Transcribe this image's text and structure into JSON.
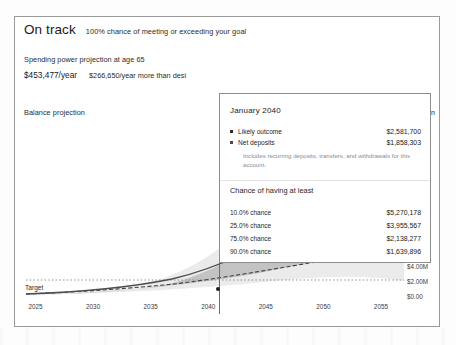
{
  "header": {
    "status_title": "On track",
    "status_subtitle": "100% chance of meeting or exceeding your goal"
  },
  "spending": {
    "label": "Spending power projection at age 65",
    "primary_value": "$453,477/year",
    "secondary_value": "$266,650/year more than desi"
  },
  "balance": {
    "label": "Balance projection",
    "right_label": "ection"
  },
  "target": {
    "label": "Target"
  },
  "tooltip": {
    "title": "January 2040",
    "rows": [
      {
        "bullet": "solid-square-bullet",
        "name": "Likely outcome",
        "value": "$2,581,700"
      },
      {
        "bullet": "solid-square-bullet",
        "name": "Net deposits",
        "value": "$1,858,303"
      }
    ],
    "note": "Includes recurring deposits, transfers, and withdrawals for this account.",
    "subheading": "Chance of having at least",
    "chances": [
      {
        "label": "10.0% chance",
        "value": "$5,270,178"
      },
      {
        "label": "25.0% chance",
        "value": "$3,955,567"
      },
      {
        "label": "75.0% chance",
        "value": "$2,138,277"
      },
      {
        "label": "90.0% chance",
        "value": "$1,639,896"
      }
    ]
  },
  "chart_data": {
    "type": "area",
    "title": "Balance projection",
    "xlabel": "",
    "ylabel": "",
    "grid": false,
    "legend_position": "none",
    "x": [
      2025,
      2030,
      2035,
      2040,
      2045,
      2050,
      2055
    ],
    "xtick_labels": [
      "2025",
      "2030",
      "2035",
      "2040",
      "2045",
      "2050",
      "2055"
    ],
    "xlim": [
      2024,
      2057
    ],
    "ytick_labels": [
      "$22.0M",
      "$20.0M",
      "$18.0M",
      "$16.0M",
      "$14.0M",
      "$12.0M",
      "$10.0M",
      "$8.00M",
      "$6.00M",
      "$4.00M",
      "$2.00M",
      "$0.00"
    ],
    "ytick_values": [
      22000000,
      20000000,
      18000000,
      16000000,
      14000000,
      12000000,
      10000000,
      8000000,
      6000000,
      4000000,
      2000000,
      0
    ],
    "ylim": [
      0,
      23000000
    ],
    "series": [
      {
        "name": "Likely outcome",
        "type": "line",
        "style": "solid",
        "color": "#4a4a4a",
        "x": [
          2025,
          2030,
          2035,
          2040,
          2045,
          2050,
          2055,
          2057
        ],
        "values": [
          120000,
          460000,
          1180000,
          2581700,
          4100000,
          6200000,
          9200000,
          10400000
        ]
      },
      {
        "name": "Net deposits",
        "type": "line",
        "style": "dashed",
        "color": "#3a3a3a",
        "x": [
          2025,
          2030,
          2035,
          2040,
          2045,
          2050,
          2055,
          2057
        ],
        "values": [
          110000,
          420000,
          1000000,
          1858303,
          2500000,
          3050000,
          3500000,
          3650000
        ]
      },
      {
        "name": "Target",
        "type": "line",
        "style": "dotted",
        "color": "#8a8a8a",
        "x": [
          2025,
          2057
        ],
        "values": [
          1950000,
          1950000
        ]
      },
      {
        "name": "10.0% - 90.0% band",
        "type": "band",
        "color": "#e8e8e8",
        "x": [
          2025,
          2030,
          2035,
          2040,
          2045,
          2050,
          2055,
          2057
        ],
        "upper": [
          150000,
          700000,
          2100000,
          5270178,
          9400000,
          15200000,
          22000000,
          23000000
        ],
        "lower": [
          100000,
          380000,
          880000,
          1639896,
          2400000,
          3400000,
          4700000,
          5200000
        ]
      },
      {
        "name": "25.0% - 75.0% band",
        "type": "band",
        "color": "#bcbcbc",
        "x": [
          2025,
          2030,
          2035,
          2040,
          2045,
          2050,
          2055,
          2057
        ],
        "upper": [
          135000,
          560000,
          1550000,
          3955567,
          6600000,
          10300000,
          15000000,
          16500000
        ],
        "lower": [
          110000,
          420000,
          1010000,
          2138277,
          3150000,
          4600000,
          6600000,
          7200000
        ]
      }
    ],
    "annotations": [
      {
        "type": "crosshair",
        "x": 2040,
        "label": "January 2040"
      },
      {
        "type": "point",
        "x": 2040,
        "y": 2581700
      },
      {
        "type": "text",
        "text": "Target",
        "x": 2025,
        "y": 1950000
      }
    ]
  }
}
